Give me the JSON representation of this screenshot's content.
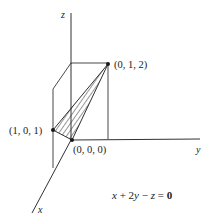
{
  "diagram": {
    "axes": {
      "x_label": "x",
      "y_label": "y",
      "z_label": "z"
    },
    "points": [
      {
        "name": "origin",
        "label": "(0, 0, 0)"
      },
      {
        "name": "point-1-0-1",
        "label": "(1, 0, 1)"
      },
      {
        "name": "point-0-1-2",
        "label": "(0, 1, 2)"
      }
    ],
    "equation": {
      "lhs_x": "x",
      "plus": " + 2",
      "lhs_y": "y",
      "minus": " − ",
      "lhs_z": "z",
      "equals": " = ",
      "rhs": "0"
    },
    "colors": {
      "line": "#1a1a1a",
      "background": "#ffffff"
    }
  }
}
